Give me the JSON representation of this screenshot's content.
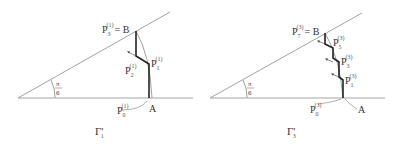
{
  "diagrams": [
    {
      "caption": "Γ",
      "caption_prime": "′",
      "caption_sub": "1",
      "angle_label_num": "π",
      "angle_label_den": "6",
      "point_A": "A",
      "point_B_label": "= B",
      "P3": {
        "base": "P",
        "sub": "3",
        "sup": "(1)"
      },
      "P2": {
        "base": "P",
        "sub": "2",
        "sup": "(1)"
      },
      "P1": {
        "base": "P",
        "sub": "1",
        "sup": "(1)"
      },
      "P0": {
        "base": "P",
        "sub": "0",
        "sup": "(1)"
      }
    },
    {
      "caption": "Γ",
      "caption_prime": "′",
      "caption_sub": "3",
      "angle_label_num": "π",
      "angle_label_den": "6",
      "point_A": "A",
      "point_B_label": "= B",
      "P7": {
        "base": "P",
        "sub": "7",
        "sup": "(3)"
      },
      "P5": {
        "base": "P",
        "sub": "5",
        "sup": "(3)"
      },
      "P3": {
        "base": "P",
        "sub": "3",
        "sup": "(3)"
      },
      "P1": {
        "base": "P",
        "sub": "1",
        "sup": "(3)"
      },
      "P0": {
        "base": "P",
        "sub": "0",
        "sup": "(3)"
      }
    }
  ],
  "colors": {
    "line": "#888888",
    "path": "#222222",
    "text": "#333333"
  }
}
